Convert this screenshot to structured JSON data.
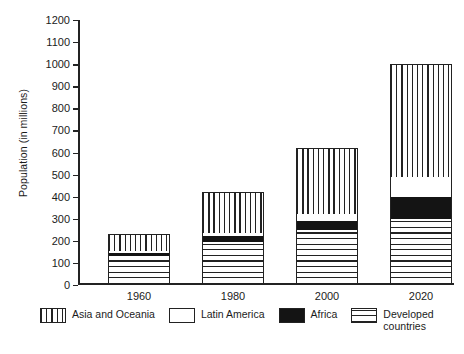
{
  "chart_data": {
    "type": "bar",
    "title": "",
    "subtitle": "",
    "xlabel": "",
    "ylabel": "Population (in millions)",
    "categories": [
      "1960",
      "1980",
      "2000",
      "2020"
    ],
    "ylim": [
      0,
      1200
    ],
    "ytick_step": 100,
    "yticks": [
      "1200",
      "1100",
      "1000",
      "900",
      "800",
      "700",
      "600",
      "500",
      "400",
      "300",
      "200",
      "100",
      "0"
    ],
    "grid": false,
    "stacked": true,
    "legend_position": "bottom",
    "series": [
      {
        "name": "Developed countries",
        "pattern": "horizontal-lines",
        "values": [
          130,
          195,
          250,
          300
        ]
      },
      {
        "name": "Africa",
        "pattern": "solid-black",
        "values": [
          15,
          25,
          40,
          100
        ]
      },
      {
        "name": "Latin America",
        "pattern": "white",
        "values": [
          10,
          15,
          30,
          90
        ]
      },
      {
        "name": "Asia and Oceania",
        "pattern": "vertical-lines",
        "values": [
          75,
          185,
          300,
          510
        ]
      }
    ],
    "totals": [
      230,
      420,
      620,
      1000
    ],
    "legend": [
      {
        "label": "Asia and Oceania",
        "pattern": "vertical-lines",
        "wrap": false
      },
      {
        "label": "Latin America",
        "pattern": "white",
        "wrap": false
      },
      {
        "label": "Africa",
        "pattern": "solid-black",
        "wrap": false
      },
      {
        "label": "Developed countries",
        "pattern": "horizontal-lines",
        "wrap": true
      }
    ],
    "colors": {
      "axis": "#232323",
      "hatch": "#222222",
      "black_fill": "#141414",
      "background": "#ffffff"
    }
  }
}
